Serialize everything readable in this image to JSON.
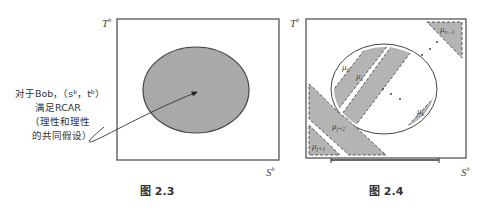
{
  "figures": [
    {
      "id": "fig-2-3",
      "caption": "图 2.3",
      "axes": {
        "y_label": "T",
        "y_sup": "b",
        "x_label": "S",
        "x_sup": "b"
      },
      "annotation": {
        "line1": "对于Bob，（s",
        "line1_sup_s": "b",
        "line1_mid": "，t",
        "line1_sup_t": "b",
        "line1_end": "）",
        "line2": "满足RCAR",
        "line3": "（理性和理性",
        "line4": "的共同假设）"
      },
      "region_fill": "#a9a9a9"
    },
    {
      "id": "fig-2-4",
      "caption": "图 2.4",
      "axes": {
        "y_label": "T",
        "y_sup": "b",
        "x_label": "S",
        "x_sup": "b"
      },
      "regions": [
        {
          "label": "μ",
          "sub": "0"
        },
        {
          "label": "μ",
          "sub": "1"
        },
        {
          "label": "μ",
          "sub": "k"
        },
        {
          "label": "μ",
          "sub": "n−1"
        },
        {
          "label": "μ",
          "sub": "j+2"
        },
        {
          "label": "μ",
          "sub": "j+1"
        }
      ],
      "region_fill": "#b4b4b4"
    }
  ]
}
